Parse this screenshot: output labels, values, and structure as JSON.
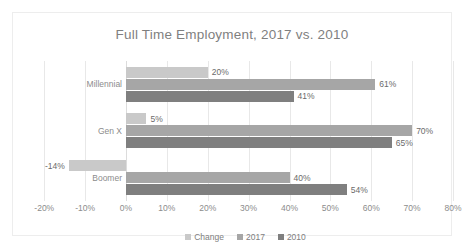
{
  "chart_data": {
    "type": "bar",
    "orientation": "horizontal",
    "title": "Full Time Employment, 2017 vs. 2010",
    "xlabel": "",
    "ylabel": "",
    "categories": [
      "Millennial",
      "Gen X",
      "Boomer"
    ],
    "series": [
      {
        "name": "Change",
        "values": [
          20,
          5,
          -14
        ],
        "labels": [
          "20%",
          "5%",
          "-14%"
        ],
        "color": "#c9c9c9"
      },
      {
        "name": "2017",
        "values": [
          61,
          70,
          40
        ],
        "labels": [
          "61%",
          "70%",
          "40%"
        ],
        "color": "#a6a6a6"
      },
      {
        "name": "2010",
        "values": [
          41,
          65,
          54
        ],
        "labels": [
          "41%",
          "65%",
          "54%"
        ],
        "color": "#7f7f7f"
      }
    ],
    "xlim": [
      -20,
      80
    ],
    "xticks": [
      -20,
      -10,
      0,
      10,
      20,
      30,
      40,
      50,
      60,
      70,
      80
    ],
    "xtick_labels": [
      "-20%",
      "-10%",
      "0%",
      "10%",
      "20%",
      "30%",
      "40%",
      "50%",
      "60%",
      "70%",
      "80%"
    ],
    "grid": true,
    "legend_position": "bottom",
    "value_format": "percent"
  },
  "legend": {
    "items": [
      {
        "label": "Change",
        "color": "#c9c9c9"
      },
      {
        "label": "2017",
        "color": "#a6a6a6"
      },
      {
        "label": "2010",
        "color": "#7f7f7f"
      }
    ]
  },
  "colors": {
    "title": "#7f7f7f",
    "axis_text": "#8c8c8c",
    "value_text": "#6b6b6b",
    "gridline": "#e8e8e8",
    "frame": "#ededed",
    "background": "#ffffff"
  }
}
